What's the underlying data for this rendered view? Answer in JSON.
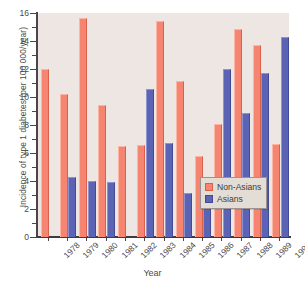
{
  "chart_data": {
    "type": "bar",
    "title": "",
    "xlabel": "Year",
    "ylabel": "Incidence of type 1 diabetes (per 100 000/year)",
    "categories": [
      "1978",
      "1979",
      "1980",
      "1981",
      "1982",
      "1983",
      "1984",
      "1985",
      "1986",
      "1987",
      "1988",
      "1989",
      "1990"
    ],
    "series": [
      {
        "name": "Non-Asians",
        "color": "#f58570",
        "values": [
          12.0,
          10.25,
          15.65,
          9.45,
          6.5,
          6.55,
          15.4,
          11.15,
          5.8,
          8.05,
          14.85,
          13.75,
          6.65
        ]
      },
      {
        "name": "Asians",
        "color": "#5b63b5",
        "values": [
          null,
          4.3,
          4.0,
          3.9,
          null,
          10.55,
          6.7,
          3.15,
          2.95,
          12.0,
          8.85,
          11.7,
          14.3
        ]
      }
    ],
    "ylim": [
      0,
      16
    ],
    "yticks": [
      0,
      2,
      4,
      6,
      8,
      10,
      12,
      14,
      16
    ],
    "ytick_labels": [
      "0",
      "2",
      "4",
      "6",
      "8",
      "10",
      "12",
      "14",
      "16"
    ],
    "yminor_step": 1,
    "grid": false,
    "legend_position": "bottom-right",
    "plot_background": "#ede6e2",
    "figure_background": "#ffffff"
  },
  "legend": {
    "entries": [
      {
        "label": "Non-Asians"
      },
      {
        "label": "Asians"
      }
    ]
  }
}
